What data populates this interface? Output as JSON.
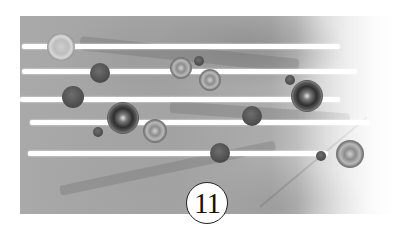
{
  "figure": {
    "label": "11",
    "colors": {
      "background": "#ffffff",
      "paint_mid": "#a8a8a8",
      "spot_dark": "#3d3d3d",
      "stripe": "#ffffff",
      "label_border": "#222222"
    }
  },
  "stripes": [
    {
      "x": 22,
      "y": 44,
      "w": 318
    },
    {
      "x": 22,
      "y": 69,
      "w": 335
    },
    {
      "x": 20,
      "y": 97,
      "w": 320
    },
    {
      "x": 30,
      "y": 120,
      "w": 340
    },
    {
      "x": 28,
      "y": 151,
      "w": 300
    }
  ],
  "spots": [
    {
      "type": "lightring",
      "x": 61,
      "y": 47,
      "r": 13
    },
    {
      "type": "solid",
      "x": 100,
      "y": 73,
      "r": 10
    },
    {
      "type": "solid",
      "x": 73,
      "y": 97,
      "r": 11
    },
    {
      "type": "darkring",
      "x": 123,
      "y": 118,
      "r": 15
    },
    {
      "type": "ring",
      "x": 155,
      "y": 131,
      "r": 11
    },
    {
      "type": "solid",
      "x": 98,
      "y": 132,
      "r": 5
    },
    {
      "type": "ring",
      "x": 181,
      "y": 68,
      "r": 10
    },
    {
      "type": "solid",
      "x": 199,
      "y": 61,
      "r": 5
    },
    {
      "type": "ring",
      "x": 210,
      "y": 80,
      "r": 10
    },
    {
      "type": "solid",
      "x": 252,
      "y": 116,
      "r": 10
    },
    {
      "type": "solid",
      "x": 290,
      "y": 80,
      "r": 5
    },
    {
      "type": "darkring",
      "x": 307,
      "y": 96,
      "r": 15
    },
    {
      "type": "solid",
      "x": 220,
      "y": 153,
      "r": 10
    },
    {
      "type": "solid",
      "x": 321,
      "y": 156,
      "r": 5
    },
    {
      "type": "ring",
      "x": 350,
      "y": 154,
      "r": 13
    }
  ]
}
